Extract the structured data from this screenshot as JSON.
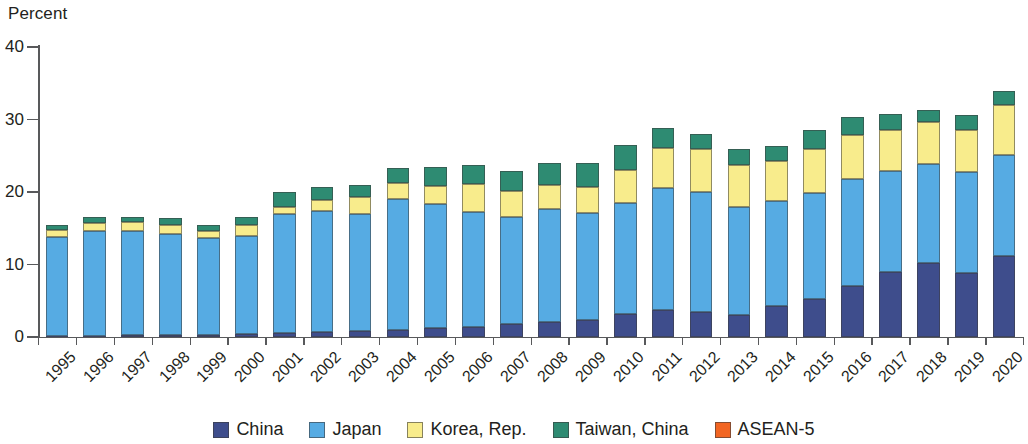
{
  "chart_data": {
    "type": "bar",
    "subtype": "stacked-column",
    "title": "",
    "subtitle": "",
    "xlabel": "",
    "ylabel": "Percent",
    "ylim": [
      0,
      40
    ],
    "yticks": [
      0,
      10,
      20,
      30,
      40
    ],
    "ytick_labels": [
      "0",
      "10",
      "20",
      "30",
      "40"
    ],
    "grid": false,
    "legend_position": "bottom",
    "stacked": true,
    "categories": [
      "1995",
      "1996",
      "1997",
      "1998",
      "1999",
      "2000",
      "2001",
      "2002",
      "2003",
      "2004",
      "2005",
      "2006",
      "2007",
      "2008",
      "2009",
      "2010",
      "2011",
      "2012",
      "2013",
      "2014",
      "2015",
      "2016",
      "2017",
      "2018",
      "2019",
      "2020"
    ],
    "series": [
      {
        "name": "China",
        "color": "#3E4D8C",
        "values": [
          0.2,
          0.2,
          0.3,
          0.3,
          0.3,
          0.4,
          0.5,
          0.7,
          0.8,
          1.0,
          1.2,
          1.4,
          1.8,
          2.1,
          2.4,
          3.2,
          3.7,
          3.5,
          3.0,
          4.3,
          5.2,
          7.0,
          8.9,
          10.2,
          8.8,
          11.2
        ]
      },
      {
        "name": "Japan",
        "color": "#56ABE3",
        "values": [
          13.6,
          14.4,
          14.3,
          13.9,
          13.3,
          13.5,
          16.4,
          16.7,
          16.2,
          18.1,
          17.2,
          15.8,
          14.7,
          15.6,
          14.7,
          15.3,
          16.9,
          16.5,
          14.9,
          14.4,
          14.7,
          14.8,
          14.0,
          13.7,
          13.9,
          13.9
        ]
      },
      {
        "name": "Korea, Rep.",
        "color": "#F8EC8C",
        "values": [
          0.9,
          1.1,
          1.2,
          1.2,
          1.0,
          1.5,
          1.0,
          1.5,
          2.3,
          2.1,
          2.4,
          3.9,
          3.7,
          3.3,
          3.6,
          4.6,
          5.5,
          5.9,
          5.8,
          5.6,
          6.0,
          6.0,
          5.7,
          5.8,
          5.8,
          6.9
        ]
      },
      {
        "name": "Taiwan, China",
        "color": "#2E8B72",
        "values": [
          0.8,
          0.8,
          0.8,
          1.0,
          0.8,
          1.1,
          2.1,
          1.8,
          1.7,
          2.1,
          2.6,
          2.6,
          2.7,
          3.0,
          3.3,
          3.4,
          2.7,
          2.1,
          2.2,
          2.1,
          2.6,
          2.6,
          2.1,
          1.6,
          2.1,
          2.0
        ]
      },
      {
        "name": "ASEAN-5",
        "color": "#F26522",
        "values": [
          0,
          0,
          0,
          0,
          0,
          0,
          0,
          0,
          0,
          0,
          0,
          0,
          0,
          0,
          0,
          0,
          0,
          0,
          0,
          0,
          0,
          0,
          0,
          0,
          0,
          0
        ]
      }
    ],
    "totals": [
      15.5,
      16.5,
      16.6,
      16.4,
      15.4,
      16.5,
      20.0,
      20.7,
      21.0,
      23.3,
      23.4,
      23.7,
      22.9,
      24.0,
      24.0,
      26.5,
      28.8,
      28.0,
      25.9,
      26.4,
      28.5,
      30.4,
      30.7,
      31.3,
      30.6,
      34.0
    ]
  },
  "legend": {
    "items": [
      {
        "label": "China",
        "color": "#3E4D8C"
      },
      {
        "label": "Japan",
        "color": "#56ABE3"
      },
      {
        "label": "Korea, Rep.",
        "color": "#F8EC8C"
      },
      {
        "label": "Taiwan, China",
        "color": "#2E8B72"
      },
      {
        "label": "ASEAN-5",
        "color": "#F26522"
      }
    ]
  },
  "axis": {
    "y_title": "Percent"
  }
}
